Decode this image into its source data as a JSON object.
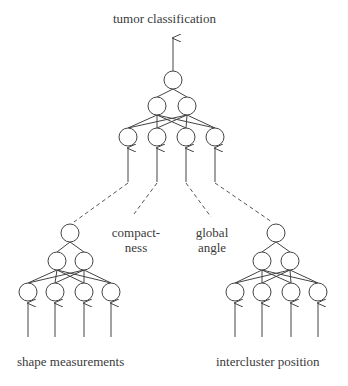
{
  "diagram": {
    "output_label": "tumor classification",
    "inputs": {
      "shape_measurements": "shape measurements",
      "intercluster_position": "intercluster position",
      "compactness_line1": "compact-",
      "compactness_line2": "ness",
      "global_angle_line1": "global",
      "global_angle_line2": "angle"
    },
    "networks": [
      {
        "name": "top-network",
        "layers": [
          1,
          2,
          4
        ]
      },
      {
        "name": "shape-network",
        "layers": [
          1,
          2,
          4
        ]
      },
      {
        "name": "intercluster-network",
        "layers": [
          1,
          2,
          4
        ]
      }
    ],
    "colors": {
      "stroke": "#444444",
      "arrow": "#555555",
      "background": "#ffffff"
    }
  }
}
